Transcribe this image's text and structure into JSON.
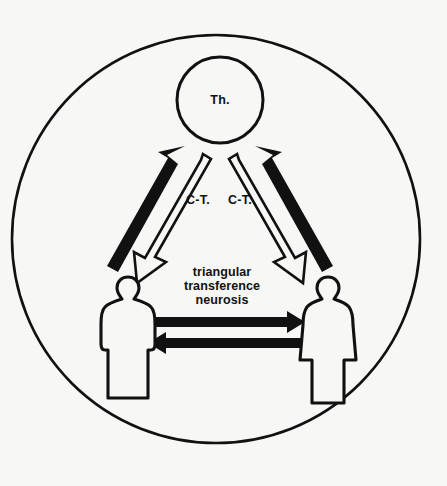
{
  "diagram": {
    "title": "triangular transference neurosis",
    "background_color": "#f7f7f5",
    "ink_color": "#111111",
    "nodes": {
      "therapist": {
        "label": "Th.",
        "shape": "circle",
        "role": "therapist"
      },
      "patient_left": {
        "label": "",
        "shape": "male-figure-silhouette",
        "role": "patient"
      },
      "patient_right": {
        "label": "",
        "shape": "female-figure-silhouette",
        "role": "patient"
      }
    },
    "labels": {
      "countertransference_left": "C-T.",
      "countertransference_right": "C-T.",
      "center_line_1": "triangular",
      "center_line_2": "transference",
      "center_line_3": "neurosis"
    },
    "arrows": [
      {
        "name": "left-transference-up",
        "from": "patient_left",
        "to": "therapist",
        "style": "solid-black",
        "direction": "up-right"
      },
      {
        "name": "left-countertransference-down",
        "from": "therapist",
        "to": "patient_left",
        "style": "hollow-outline",
        "direction": "down-left"
      },
      {
        "name": "right-transference-up",
        "from": "patient_right",
        "to": "therapist",
        "style": "solid-black",
        "direction": "up-left"
      },
      {
        "name": "right-countertransference-down",
        "from": "therapist",
        "to": "patient_right",
        "style": "hollow-outline",
        "direction": "down-right"
      },
      {
        "name": "patient-to-patient-right",
        "from": "patient_left",
        "to": "patient_right",
        "style": "solid-black",
        "direction": "right"
      },
      {
        "name": "patient-to-patient-left",
        "from": "patient_right",
        "to": "patient_left",
        "style": "solid-black",
        "direction": "left"
      }
    ]
  }
}
